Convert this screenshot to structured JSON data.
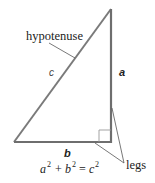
{
  "diagram": {
    "labels": {
      "hypotenuse": "hypotenuse",
      "legs": "legs",
      "side_a": "a",
      "side_b": "b",
      "side_c": "c"
    },
    "equation": {
      "a": "a",
      "b": "b",
      "c": "c",
      "exp": "2",
      "plus": "+",
      "equals": "="
    },
    "colors": {
      "triangle_stroke": "#7a7a7a",
      "leg_stroke": "#6e6e6e",
      "leader_stroke": "#555555",
      "right_angle_stroke": "#999999",
      "text": "#222222"
    }
  }
}
